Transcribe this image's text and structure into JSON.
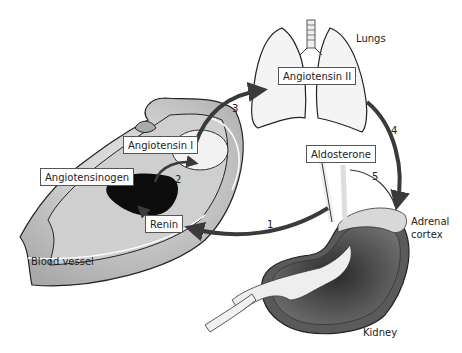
{
  "diagram": {
    "organs": {
      "lungs": "Lungs",
      "blood_vessel": "Blood vessel",
      "adrenal_cortex_line1": "Adrenal",
      "adrenal_cortex_line2": "cortex",
      "kidney": "Kidney"
    },
    "molecules": {
      "angiotensinogen": "Angiotensinogen",
      "renin": "Renin",
      "angiotensin_i": "Angiotensin I",
      "angiotensin_ii": "Angiotensin II",
      "aldosterone": "Aldosterone"
    },
    "steps": [
      "1",
      "2",
      "3",
      "4",
      "5"
    ],
    "colors": {
      "arrow": "#3a3a3a",
      "vessel_fill": "#bdbdbd",
      "vessel_dark": "#111111",
      "lung_fill": "#f4f4f4",
      "kidney_dark": "#4a4a4a"
    }
  }
}
